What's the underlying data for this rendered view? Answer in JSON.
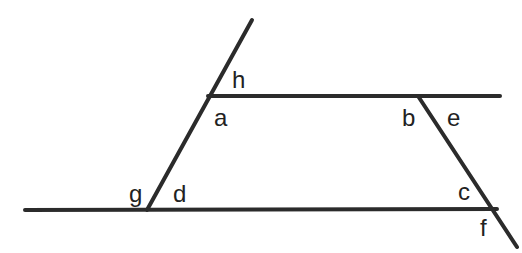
{
  "diagram": {
    "type": "parallel lines cut by transversals",
    "line_color": "#2b2b2b",
    "background": "#ffffff",
    "lines": [
      {
        "name": "left-transversal",
        "x1": 252,
        "y1": 20,
        "x2": 147,
        "y2": 210
      },
      {
        "name": "top-line",
        "x1": 208,
        "y1": 96,
        "x2": 500,
        "y2": 96
      },
      {
        "name": "bottom-line",
        "x1": 25,
        "y1": 210,
        "x2": 497,
        "y2": 209
      },
      {
        "name": "right-transversal",
        "x1": 418,
        "y1": 96,
        "x2": 517,
        "y2": 247
      }
    ],
    "labels": {
      "h": "h",
      "a": "a",
      "b": "b",
      "e": "e",
      "g": "g",
      "d": "d",
      "c": "c",
      "f": "f"
    }
  }
}
